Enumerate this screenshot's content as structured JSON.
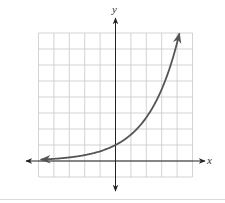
{
  "chart_data": {
    "type": "line",
    "title": "",
    "xlabel": "x",
    "ylabel": "y",
    "xlim": [
      -5,
      5
    ],
    "ylim": [
      -1,
      8
    ],
    "grid": true,
    "tick_labels": false,
    "legend": null,
    "series": [
      {
        "name": "exponential curve",
        "function": "y = e^(x/2)",
        "x": [
          -5,
          -4,
          -3,
          -2,
          -1,
          0,
          1,
          2,
          3,
          4,
          4.2
        ],
        "y": [
          0.08,
          0.14,
          0.22,
          0.37,
          0.61,
          1.0,
          1.65,
          2.72,
          4.48,
          7.39,
          8.17
        ],
        "arrow_both_ends": true,
        "color": "#555555"
      }
    ]
  },
  "labels": {
    "x_axis": "x",
    "y_axis": "y"
  },
  "colors": {
    "grid": "#c8c8c8",
    "axis": "#222222",
    "curve": "#555555",
    "background": "#ffffff"
  },
  "layout": {
    "origin_px": [
      115.5,
      161
    ],
    "unit_x_px": 15.4,
    "unit_y_px": 16
  }
}
